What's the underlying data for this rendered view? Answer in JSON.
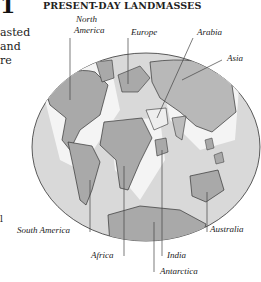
{
  "figure": {
    "title": "PRESENT-DAY LANDMASSES",
    "left_fragment": {
      "glyph": "1",
      "lines": [
        "asted",
        "and",
        "re"
      ],
      "bottom_glyph": "l"
    },
    "labels": {
      "north_america_line1": "North",
      "north_america_line2": "America",
      "europe": "Europe",
      "arabia": "Arabia",
      "asia": "Asia",
      "south_america": "South America",
      "africa": "Africa",
      "india": "India",
      "antarctica": "Antarctica",
      "australia": "Australia"
    },
    "colors": {
      "ocean": "#d9d9d9",
      "land": "#a9a9a9",
      "shelf": "#f4f4f4",
      "outline": "#333333"
    }
  }
}
